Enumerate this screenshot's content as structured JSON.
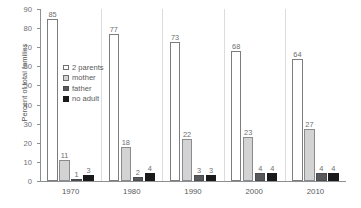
{
  "chart_data": {
    "type": "bar",
    "title": "",
    "xlabel": "",
    "ylabel": "Percent of total families",
    "ylim": [
      0,
      90
    ],
    "yticks": [
      0,
      10,
      20,
      30,
      40,
      50,
      60,
      70,
      80,
      90
    ],
    "ytick_labels": [
      "0",
      "10",
      "20",
      "30",
      "40",
      "50",
      "60",
      "70",
      "80",
      "90"
    ],
    "grid": false,
    "legend_position": "inside-upper-left",
    "categories": [
      "1970",
      "1980",
      "1990",
      "2000",
      "2010"
    ],
    "series": [
      {
        "name": "2 parents",
        "color": "#ffffff",
        "values": [
          85,
          77,
          73,
          68,
          64
        ]
      },
      {
        "name": "mother",
        "color": "#d3d3d3",
        "values": [
          11,
          18,
          22,
          23,
          27
        ]
      },
      {
        "name": "father",
        "color": "#58595b",
        "values": [
          1,
          2,
          3,
          4,
          4
        ]
      },
      {
        "name": "no adult",
        "color": "#1a1a1a",
        "values": [
          3,
          4,
          3,
          4,
          4
        ]
      }
    ],
    "value_labels": {
      "1970": [
        "85",
        "11",
        "1",
        "3"
      ],
      "1980": [
        "77",
        "18",
        "2",
        "4"
      ],
      "1990": [
        "73",
        "22",
        "3",
        "3"
      ],
      "2000": [
        "68",
        "23",
        "4",
        "4"
      ],
      "2010": [
        "64",
        "27",
        "4",
        "4"
      ]
    }
  },
  "colors": {
    "axis": "#8d8e90",
    "text": "#58595b",
    "separator": "#dcdcdc",
    "background": "#ffffff"
  }
}
